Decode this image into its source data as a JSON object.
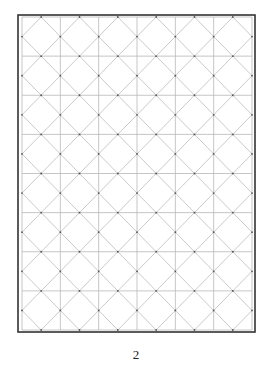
{
  "page": {
    "page_number": "2"
  },
  "grid": {
    "columns": 6,
    "rows": 8,
    "frame": {
      "x": 18,
      "y": 15,
      "width": 237,
      "height": 317
    },
    "inner": {
      "x": 22,
      "y": 17,
      "width": 230,
      "height": 313
    },
    "colors": {
      "border": "#333333",
      "grid_line": "#b8b8b8",
      "diagonal_line": "#c4c4c4",
      "dot": "#555555"
    }
  }
}
